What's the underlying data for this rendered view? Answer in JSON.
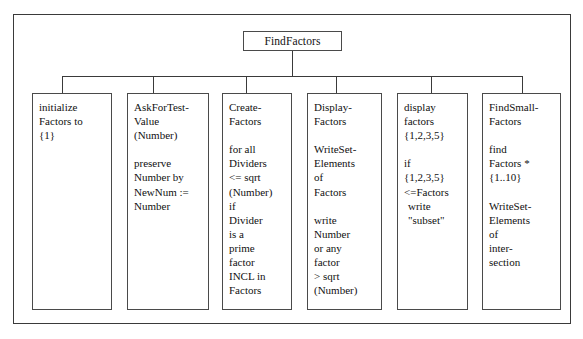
{
  "figure": {
    "frame_color": "#3a3a3a",
    "box_border_color": "#4a4a4a",
    "text_color": "#111111",
    "background": "#ffffff"
  },
  "root": {
    "label": "FindFactors"
  },
  "nodes": [
    {
      "id": "initialize-factors",
      "lines": [
        {
          "text": "initialize",
          "indent": false
        },
        {
          "text": "Factors to",
          "indent": false
        },
        {
          "text": "{1}",
          "indent": false
        }
      ]
    },
    {
      "id": "ask-for-test-value",
      "lines": [
        {
          "text": "AskForTest-",
          "indent": false
        },
        {
          "text": "Value",
          "indent": false
        },
        {
          "text": "(Number)",
          "indent": false
        },
        {
          "text": "",
          "indent": false
        },
        {
          "text": "preserve",
          "indent": false
        },
        {
          "text": "Number by",
          "indent": false
        },
        {
          "text": "NewNum :=",
          "indent": false
        },
        {
          "text": "Number",
          "indent": false
        }
      ]
    },
    {
      "id": "create-factors",
      "lines": [
        {
          "text": "Create-",
          "indent": false
        },
        {
          "text": "Factors",
          "indent": false
        },
        {
          "text": "",
          "indent": false
        },
        {
          "text": "for all",
          "indent": false
        },
        {
          "text": "Dividers",
          "indent": false
        },
        {
          "text": "<= sqrt",
          "indent": false
        },
        {
          "text": "(Number)",
          "indent": false
        },
        {
          "text": "if",
          "indent": false
        },
        {
          "text": "Divider",
          "indent": false
        },
        {
          "text": "is a",
          "indent": false
        },
        {
          "text": "prime",
          "indent": false
        },
        {
          "text": "factor",
          "indent": false
        },
        {
          "text": "INCL in",
          "indent": false
        },
        {
          "text": "Factors",
          "indent": false
        }
      ]
    },
    {
      "id": "display-factors",
      "lines": [
        {
          "text": "Display-",
          "indent": false
        },
        {
          "text": "Factors",
          "indent": false
        },
        {
          "text": "",
          "indent": false
        },
        {
          "text": "WriteSet-",
          "indent": false
        },
        {
          "text": "Elements",
          "indent": false
        },
        {
          "text": "of",
          "indent": false
        },
        {
          "text": "Factors",
          "indent": false
        },
        {
          "text": "",
          "indent": false
        },
        {
          "text": "write",
          "indent": false
        },
        {
          "text": "Number",
          "indent": false
        },
        {
          "text": "or any",
          "indent": false
        },
        {
          "text": "factor",
          "indent": false
        },
        {
          "text": "> sqrt",
          "indent": false
        },
        {
          "text": "(Number)",
          "indent": false
        }
      ]
    },
    {
      "id": "display-factors-subset",
      "lines": [
        {
          "text": "display",
          "indent": false
        },
        {
          "text": "factors",
          "indent": false
        },
        {
          "text": "{1,2,3,5}",
          "indent": false
        },
        {
          "text": "",
          "indent": false
        },
        {
          "text": "if",
          "indent": false
        },
        {
          "text": "{1,2,3,5}",
          "indent": false
        },
        {
          "text": "<=Factors",
          "indent": false
        },
        {
          "text": "write",
          "indent": true
        },
        {
          "text": "\"subset\"",
          "indent": true
        }
      ]
    },
    {
      "id": "find-small-factors",
      "lines": [
        {
          "text": "FindSmall-",
          "indent": false
        },
        {
          "text": "Factors",
          "indent": false
        },
        {
          "text": "",
          "indent": false
        },
        {
          "text": "find",
          "indent": false
        },
        {
          "text": "Factors *",
          "indent": false
        },
        {
          "text": "{1..10}",
          "indent": false
        },
        {
          "text": "",
          "indent": false
        },
        {
          "text": "WriteSet-",
          "indent": false
        },
        {
          "text": "Elements",
          "indent": false
        },
        {
          "text": "of",
          "indent": false
        },
        {
          "text": "inter-",
          "indent": false
        },
        {
          "text": "section",
          "indent": false
        }
      ]
    }
  ]
}
